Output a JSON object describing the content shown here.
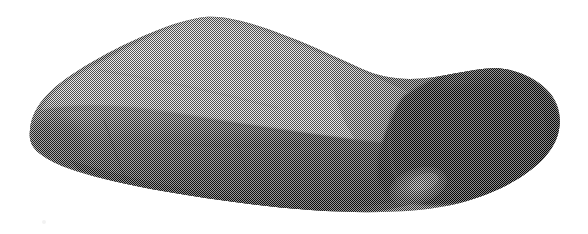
{
  "image": {
    "title": "Halftone print of a rounded rectangular cushion-like object",
    "subject": "pillow-shaped box",
    "medium": "coarse black-and-white halftone screen print (scanned)",
    "background_color": "#ffffff",
    "ink_color": "#111111",
    "canvas": {
      "width": 588,
      "height": 234
    },
    "alt_text": "A three-quarter view of a soft rounded rectangular object, like a pillow or a foam box, printed in a coarse halftone dot screen. The broad top face is light grey, the long front face is mid to dark grey, and the rounded right end is almost solid black."
  },
  "palette": {
    "paper": "#ffffff",
    "top_light": "#d8d8d8",
    "top_mid": "#b4b4b4",
    "top_dark": "#8a8a8a",
    "front_light": "#7a7a7a",
    "front_mid": "#4a4a4a",
    "front_dark": "#262626",
    "cap_dark": "#1a1a1a",
    "cap_black": "#0d0d0d",
    "glint": "#9a9a9a"
  },
  "halftone": {
    "type": "orthogonal dot screen",
    "cell_px": 2,
    "angle_deg": 45,
    "description": "fine checkerboard dot grid, roughly two pixels per cell"
  },
  "regions": [
    {
      "id": "top-face",
      "label": "Top face",
      "tone": "light grey",
      "note": "Broad upper surface sloping from lower-left up to a ridge near the upper middle, then falling away to the right."
    },
    {
      "id": "front-face",
      "label": "Front face",
      "tone": "mid grey with a lighter band near the top crease",
      "note": "Long side wall running from the left tip to the lower right."
    },
    {
      "id": "right-cap",
      "label": "Rounded right end",
      "tone": "near black",
      "note": "The rolled, bulging end cap in deepest shadow."
    },
    {
      "id": "left-tip",
      "label": "Rounded left end",
      "tone": "mid grey",
      "note": "Softly rounded left corner where top and front meet."
    },
    {
      "id": "glint",
      "label": "Lower right highlight",
      "tone": "lighter grey crescent",
      "note": "A small curved lighter area low on the right of the front face."
    }
  ],
  "geometry": {
    "top_ridge_peak": {
      "x": 195,
      "y": 18
    },
    "left_tip": {
      "x": 30,
      "y": 128
    },
    "right_extent": {
      "x": 560,
      "y": 115
    },
    "bottom_left_edge": {
      "x": 62,
      "y": 166
    },
    "bottom_right_edge": {
      "x": 430,
      "y": 212
    },
    "crease_left": {
      "x": 42,
      "y": 100
    },
    "crease_right": {
      "x": 420,
      "y": 135
    }
  }
}
